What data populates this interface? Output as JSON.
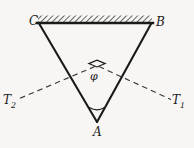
{
  "figure": {
    "background_color": "#f7f6f4",
    "stroke_color": "#1a1a1a",
    "dash_color": "#3a3a3a",
    "hatch_color": "#555555"
  },
  "labels": {
    "vertex_c": "C",
    "vertex_b": "B",
    "vertex_a": "A",
    "tension_left_base": "T",
    "tension_left_sub": "2",
    "tension_right_base": "T",
    "tension_right_sub": "1",
    "angle_phi": "φ"
  },
  "geometry": {
    "ceiling": {
      "x_start": 38,
      "x_end": 152,
      "y": 23,
      "hatch_height": 7,
      "hatch_angle_deg": 45,
      "line_width": 2.2
    },
    "triangle": {
      "vertices": [
        {
          "name": "C",
          "x": 38,
          "y": 22
        },
        {
          "name": "B",
          "x": 152,
          "y": 23
        },
        {
          "name": "A",
          "x": 97,
          "y": 122
        }
      ],
      "line_width": 2.0
    },
    "dashed_lines": [
      {
        "name": "T2",
        "x1": 95,
        "y1": 66,
        "x2": 17,
        "y2": 99
      },
      {
        "name": "T1",
        "x1": 99,
        "y1": 66,
        "x2": 172,
        "y2": 99
      }
    ],
    "right_angle_marker": {
      "apex_x": 97,
      "apex_y": 66,
      "size": 9
    },
    "angle_arc_a": {
      "cx": 97,
      "cy": 122,
      "radius": 15,
      "start_deg": 242,
      "end_deg": 298
    }
  }
}
